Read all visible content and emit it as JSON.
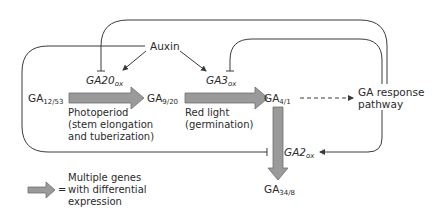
{
  "nodes": {
    "auxin": "Auxin",
    "ga12_53": {
      "base": "GA",
      "sub": "12/53"
    },
    "ga9_20": {
      "base": "GA",
      "sub": "9/20"
    },
    "ga4_1": {
      "base": "GA",
      "sub": "4/1"
    },
    "ga34_8": {
      "base": "GA",
      "sub": "34/8"
    },
    "response_line1": "GA response",
    "response_line2": "pathway"
  },
  "genes": {
    "ga20ox": {
      "base": "GA20",
      "sub": "ox"
    },
    "ga3ox": {
      "base": "GA3",
      "sub": "ox"
    },
    "ga2ox": {
      "base": "GA2",
      "sub": "ox"
    }
  },
  "annotations": {
    "photoperiod": [
      "Photoperiod",
      "(stem elongation",
      "and tuberization)"
    ],
    "red_light": [
      "Red light",
      "(germination)"
    ]
  },
  "legend": {
    "symbol": "=",
    "lines": [
      "Multiple genes",
      "with differential",
      "expression"
    ]
  },
  "colors": {
    "line": "#3a3a3a",
    "arrow_fill": "#9a9a9a",
    "arrow_stroke": "#6e6e6e"
  }
}
